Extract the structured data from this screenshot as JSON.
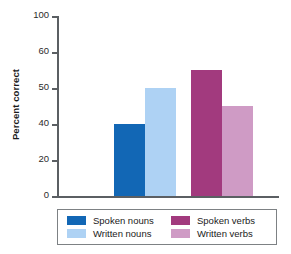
{
  "chart_data": {
    "type": "bar",
    "title": "",
    "xlabel": "",
    "ylabel": "Percent correct",
    "ylim": [
      0,
      100
    ],
    "grid": false,
    "legend_position": "bottom",
    "yticks": [
      "100",
      "60",
      "50",
      "40",
      "20",
      "0"
    ],
    "categories": [
      "Spoken nouns",
      "Written nouns",
      "Spoken verbs",
      "Written verbs"
    ],
    "values": [
      40,
      60,
      70,
      50
    ],
    "series": [
      {
        "name": "Spoken nouns",
        "value": 40,
        "color": "#1267b5"
      },
      {
        "name": "Written nouns",
        "value": 60,
        "color": "#aed2f4"
      },
      {
        "name": "Spoken verbs",
        "value": 70,
        "color": "#a23a7e"
      },
      {
        "name": "Written verbs",
        "value": 50,
        "color": "#cf9bc5"
      }
    ]
  },
  "axis": {
    "y_title": "Percent correct",
    "ticks": [
      {
        "label": "100"
      },
      {
        "label": "60"
      },
      {
        "label": "50"
      },
      {
        "label": "40"
      },
      {
        "label": "20"
      },
      {
        "label": "0"
      }
    ]
  },
  "legend": {
    "entries": [
      {
        "label": "Spoken nouns",
        "color": "#1267b5"
      },
      {
        "label": "Spoken verbs",
        "color": "#a23a7e"
      },
      {
        "label": "Written nouns",
        "color": "#aed2f4"
      },
      {
        "label": "Written verbs",
        "color": "#cf9bc5"
      }
    ]
  }
}
